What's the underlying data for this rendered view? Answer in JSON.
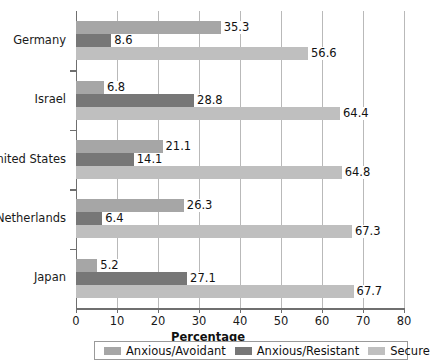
{
  "chart_data": {
    "type": "bar",
    "orientation": "horizontal",
    "title": "",
    "xlabel": "Percentage",
    "ylabel": "",
    "xlim": [
      0,
      80
    ],
    "xticks": [
      0,
      10,
      20,
      30,
      40,
      50,
      60,
      70,
      80
    ],
    "xticklabels": [
      "0",
      "10",
      "20",
      "30",
      "40",
      "50",
      "60",
      "70",
      "80"
    ],
    "grid": "vertical",
    "legend_position": "bottom",
    "categories": [
      "Germany",
      "Israel",
      "United States",
      "Netherlands",
      "Japan"
    ],
    "series": [
      {
        "name": "Anxious/Avoidant",
        "color": "#a6a6a6",
        "values": [
          35.3,
          6.8,
          21.1,
          26.3,
          5.2
        ],
        "labels": [
          "35.3",
          "6.8",
          "21.1",
          "26.3",
          "5.2"
        ]
      },
      {
        "name": "Anxious/Resistant",
        "color": "#777777",
        "values": [
          8.6,
          28.8,
          14.1,
          6.4,
          27.1
        ],
        "labels": [
          "8.6",
          "28.8",
          "14.1",
          "6.4",
          "27.1"
        ]
      },
      {
        "name": "Secure",
        "color": "#bfbfbf",
        "values": [
          56.6,
          64.4,
          64.8,
          67.3,
          67.7
        ],
        "labels": [
          "56.6",
          "64.4",
          "64.8",
          "67.3",
          "67.7"
        ]
      }
    ]
  },
  "legend": {
    "items": [
      {
        "label": "Anxious/Avoidant",
        "swatch": "avoidant"
      },
      {
        "label": "Anxious/Resistant",
        "swatch": "resistant"
      },
      {
        "label": "Secure",
        "swatch": "secure"
      }
    ]
  },
  "axis": {
    "x_title": "Percentage"
  }
}
